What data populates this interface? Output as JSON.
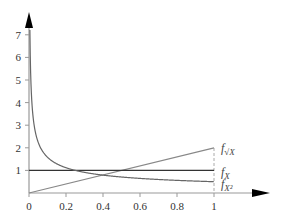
{
  "chart_data": {
    "type": "line",
    "title": "",
    "xlabel": "",
    "ylabel": "",
    "xlim": [
      0,
      1
    ],
    "ylim": [
      0,
      7.5
    ],
    "grid": false,
    "x_ticks": [
      "0",
      "0.2",
      "0.4",
      "0.6",
      "0.8",
      "1"
    ],
    "y_ticks": [
      "1",
      "2",
      "3",
      "4",
      "5",
      "6",
      "7"
    ],
    "series": [
      {
        "name": "f_sqrt(X)",
        "label_main": "f",
        "label_sub": "√X",
        "color": "#888888",
        "formula": "2x",
        "x": [
          0,
          1
        ],
        "values": [
          0,
          2
        ]
      },
      {
        "name": "f_X",
        "label_main": "f",
        "label_sub": "X",
        "color": "#333333",
        "formula": "1",
        "x": [
          0,
          1
        ],
        "values": [
          1,
          1
        ]
      },
      {
        "name": "f_X^2",
        "label_main": "f",
        "label_sub": "X²",
        "color": "#666666",
        "formula": "1/(2*sqrt(x))",
        "x": [
          0.005,
          0.01,
          0.02,
          0.05,
          0.1,
          0.2,
          0.3,
          0.4,
          0.5,
          0.6,
          0.7,
          0.8,
          0.9,
          1.0
        ],
        "values": [
          7.07,
          5.0,
          3.54,
          2.24,
          1.58,
          1.12,
          0.91,
          0.79,
          0.71,
          0.65,
          0.6,
          0.56,
          0.53,
          0.5
        ]
      }
    ],
    "annotations": [
      "dashed vertical line at x = 1"
    ],
    "legend_position": "inline-right"
  }
}
